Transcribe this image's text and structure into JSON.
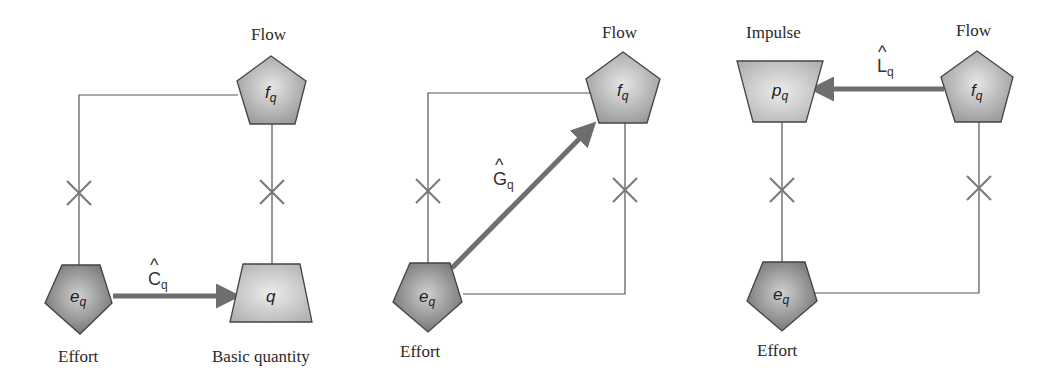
{
  "figure": {
    "panels": [
      {
        "id": "capacitance",
        "operator": {
          "letter": "C",
          "hat": "^",
          "sub": "q"
        },
        "nodes": {
          "effort": {
            "symbol": "e",
            "sub": "q",
            "label": "Effort",
            "shape": "pentagon"
          },
          "flow": {
            "symbol": "f",
            "sub": "q",
            "label": "Flow",
            "shape": "pentagon"
          },
          "quantity": {
            "symbol": "q",
            "sub": "",
            "label": "Basic quantity",
            "shape": "trapezoid"
          }
        },
        "arrow": "effort -> basic quantity"
      },
      {
        "id": "conductance",
        "operator": {
          "letter": "G",
          "hat": "^",
          "sub": "q"
        },
        "nodes": {
          "effort": {
            "symbol": "e",
            "sub": "q",
            "label": "Effort",
            "shape": "pentagon"
          },
          "flow": {
            "symbol": "f",
            "sub": "q",
            "label": "Flow",
            "shape": "pentagon"
          }
        },
        "arrow": "effort -> flow"
      },
      {
        "id": "inductance",
        "operator": {
          "letter": "L",
          "hat": "^",
          "sub": "q"
        },
        "nodes": {
          "impulse": {
            "symbol": "p",
            "sub": "q",
            "label": "Impulse",
            "shape": "inverted-trapezoid"
          },
          "flow": {
            "symbol": "f",
            "sub": "q",
            "label": "Flow",
            "shape": "pentagon"
          },
          "effort": {
            "symbol": "e",
            "sub": "q",
            "label": "Effort",
            "shape": "pentagon"
          }
        },
        "arrow": "flow -> impulse"
      }
    ],
    "colors": {
      "effort_fill_dark": "#7a7a7a",
      "flow_fill": "#a8a8a8",
      "quantity_fill": "#b8b8b8",
      "arrow": "#6e6e6e",
      "wire": "#555555",
      "xmark": "#808080"
    }
  }
}
